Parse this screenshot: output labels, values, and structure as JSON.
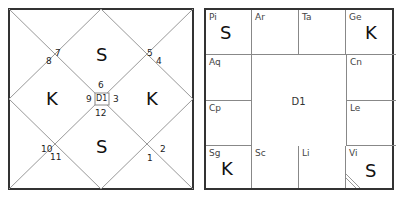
{
  "north_chart": {
    "label": "D1",
    "house_numbers": {
      "top_left_upper": "7",
      "top_left_lower": "8",
      "top_right_upper": "5",
      "top_right_lower": "4",
      "center_top": "6",
      "center_left": "9",
      "center_right": "3",
      "center_bottom": "12",
      "bottom_left_upper": "10",
      "bottom_left_lower": "11",
      "bottom_right_upper": "2",
      "bottom_right_lower": "1"
    },
    "planets": {
      "top": "S",
      "left": "K",
      "right": "K",
      "bottom": "S"
    }
  },
  "south_chart": {
    "label": "D1",
    "cells": [
      {
        "sign": "Pi",
        "planet": "S"
      },
      {
        "sign": "Ar",
        "planet": ""
      },
      {
        "sign": "Ta",
        "planet": ""
      },
      {
        "sign": "Ge",
        "planet": "K"
      },
      {
        "sign": "Aq",
        "planet": ""
      },
      {
        "sign": "Cn",
        "planet": ""
      },
      {
        "sign": "Cp",
        "planet": ""
      },
      {
        "sign": "Le",
        "planet": ""
      },
      {
        "sign": "Sg",
        "planet": "K"
      },
      {
        "sign": "Sc",
        "planet": ""
      },
      {
        "sign": "Li",
        "planet": ""
      },
      {
        "sign": "Vi",
        "planet": "S"
      }
    ]
  }
}
